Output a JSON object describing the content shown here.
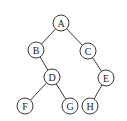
{
  "diagram": {
    "type": "binary-tree",
    "nodes": [
      {
        "id": "A",
        "label": "A",
        "x": 61,
        "y": 23
      },
      {
        "id": "B",
        "label": "B",
        "x": 36,
        "y": 50
      },
      {
        "id": "C",
        "label": "C",
        "x": 88,
        "y": 51
      },
      {
        "id": "D",
        "label": "D",
        "x": 52,
        "y": 77
      },
      {
        "id": "E",
        "label": "E",
        "x": 106,
        "y": 78
      },
      {
        "id": "F",
        "label": "F",
        "x": 25,
        "y": 106
      },
      {
        "id": "G",
        "label": "G",
        "x": 70,
        "y": 106
      },
      {
        "id": "H",
        "label": "H",
        "x": 90,
        "y": 106
      }
    ],
    "edges": [
      {
        "from": "A",
        "to": "B"
      },
      {
        "from": "A",
        "to": "C"
      },
      {
        "from": "B",
        "to": "D"
      },
      {
        "from": "C",
        "to": "E"
      },
      {
        "from": "D",
        "to": "F"
      },
      {
        "from": "D",
        "to": "G"
      },
      {
        "from": "E",
        "to": "H"
      }
    ],
    "node_radius": 8,
    "colors": {
      "stroke": "#3a3a3a",
      "fill": "#ffffff",
      "text": "#222222"
    }
  }
}
